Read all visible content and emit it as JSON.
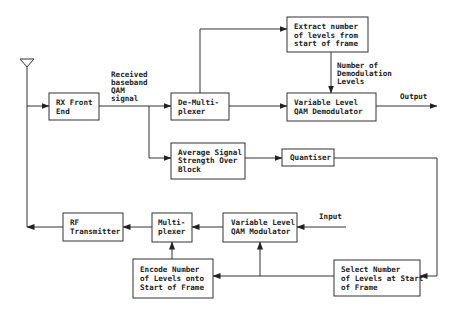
{
  "diagram": {
    "type": "block-diagram",
    "title": "",
    "colors": {
      "line": "#333333",
      "background": "#ffffff",
      "text": "#222222"
    },
    "annotations": {
      "received": [
        "Received",
        "baseband",
        "QAM",
        "signal"
      ],
      "num_levels": [
        "Number of",
        "Demodulation",
        "Levels"
      ],
      "output": "Output",
      "input": "Input"
    },
    "blocks": {
      "rx_front_end": [
        "RX Front",
        "End"
      ],
      "demux": [
        "De-Multi-",
        "plexer"
      ],
      "extract": [
        "Extract number",
        "of levels from",
        "start of frame"
      ],
      "demodulator": [
        "Variable Level",
        "QAM Demodulator"
      ],
      "avg_signal": [
        "Average Signal",
        "Strength Over",
        "Block"
      ],
      "quantiser": [
        "Quantiser"
      ],
      "rf_tx": [
        "RF",
        "Transmitter"
      ],
      "mux": [
        "Multi-",
        "plexer"
      ],
      "modulator": [
        "Variable Level",
        "QAM Modulator"
      ],
      "encode": [
        "Encode Number",
        "of Levels onto",
        "Start of Frame"
      ],
      "select": [
        "Select Number",
        "of Levels at Start",
        "of Frame"
      ]
    },
    "connections": [
      {
        "from": "antenna",
        "to": "rx_front_end"
      },
      {
        "from": "rx_front_end",
        "to": "demux"
      },
      {
        "from": "rx_front_end",
        "to": "avg_signal"
      },
      {
        "from": "demux",
        "to": "extract"
      },
      {
        "from": "demux",
        "to": "demodulator"
      },
      {
        "from": "extract",
        "to": "demodulator",
        "label": "Number of Demodulation Levels"
      },
      {
        "from": "demodulator",
        "to": "output"
      },
      {
        "from": "avg_signal",
        "to": "quantiser"
      },
      {
        "from": "quantiser",
        "to": "select"
      },
      {
        "from": "input",
        "to": "modulator"
      },
      {
        "from": "select",
        "to": "modulator"
      },
      {
        "from": "select",
        "to": "encode"
      },
      {
        "from": "encode",
        "to": "mux"
      },
      {
        "from": "modulator",
        "to": "mux"
      },
      {
        "from": "mux",
        "to": "rf_tx"
      },
      {
        "from": "rf_tx",
        "to": "antenna"
      }
    ]
  }
}
